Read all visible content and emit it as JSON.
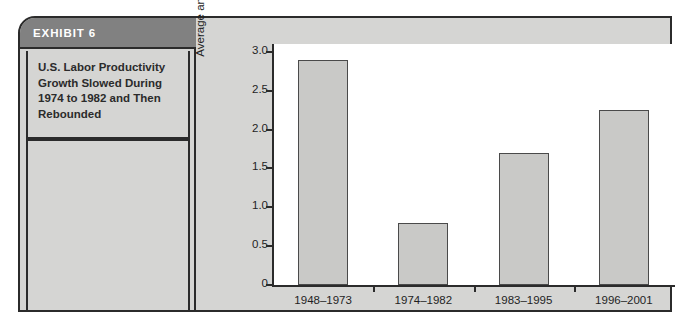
{
  "exhibit": {
    "header_label": "EXHIBIT 6",
    "caption": "U.S. Labor Productivity Growth Slowed During 1974 to 1982 and Then Rebounded"
  },
  "colors": {
    "frame_background": "#d5d5d3",
    "frame_border": "#2b2b2b",
    "header_band": "#818181",
    "header_text": "#ffffff",
    "plot_background": "#ffffff",
    "bar_fill": "#c9c9c7",
    "bar_border": "#4a4a4a",
    "axis": "#2b2b2b"
  },
  "chart_data": {
    "type": "bar",
    "title": "U.S. Labor Productivity Growth Slowed During 1974 to 1982 and Then Rebounded",
    "categories": [
      "1948–1973",
      "1974–1982",
      "1983–1995",
      "1996–2001"
    ],
    "values": [
      2.9,
      0.8,
      1.7,
      2.25
    ],
    "xlabel": "",
    "ylabel": "Average annual growth (percent)",
    "ylim": [
      0,
      3.1
    ],
    "yticks": [
      0,
      0.5,
      1.0,
      1.5,
      2.0,
      2.5,
      3.0
    ],
    "ytick_labels": [
      "0",
      "0.5",
      "1.0",
      "1.5",
      "2.0",
      "2.5",
      "3.0"
    ],
    "grid": false,
    "legend": null
  }
}
